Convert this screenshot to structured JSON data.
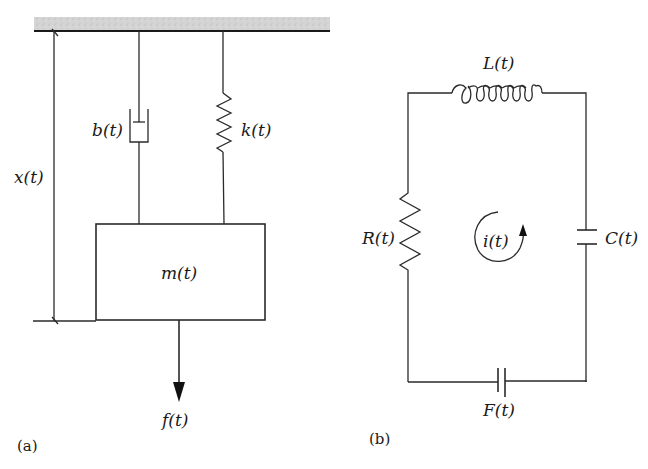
{
  "panel_a": {
    "caption": "(a)",
    "labels": {
      "displacement": "x(t)",
      "damper": "b(t)",
      "spring": "k(t)",
      "mass": "m(t)",
      "force": "f(t)"
    }
  },
  "panel_b": {
    "caption": "(b)",
    "labels": {
      "inductor": "L(t)",
      "resistor": "R(t)",
      "current": "i(t)",
      "capacitor": "C(t)",
      "source": "F(t)"
    }
  },
  "colors": {
    "ground_hatch": "#cfcfcf",
    "line": "#2a2a2a"
  }
}
